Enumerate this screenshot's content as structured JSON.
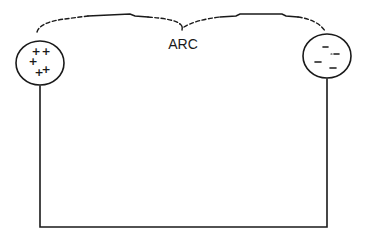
{
  "diagram": {
    "label": "ARC",
    "colors": {
      "ink": "#1a1a1a",
      "background": "#ffffff"
    },
    "left_electrode": {
      "charge": "positive",
      "symbols": [
        "+",
        "+",
        "+",
        "+",
        "+"
      ]
    },
    "right_electrode": {
      "charge": "negative",
      "symbols": [
        "-",
        "-",
        "-",
        "-",
        "-"
      ]
    }
  }
}
